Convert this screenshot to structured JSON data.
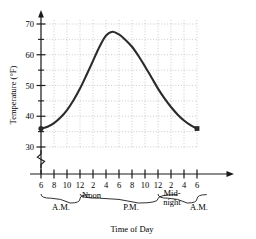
{
  "chart_data": {
    "type": "line",
    "title": "",
    "xlabel": "Time of Day",
    "ylabel": "Temperature (°F)",
    "ylim": [
      30,
      72
    ],
    "yticks": [
      30,
      40,
      50,
      60,
      70
    ],
    "ytick_labels": [
      "30",
      "40",
      "50",
      "60",
      "70"
    ],
    "yminor_ticks": [
      35,
      45,
      55,
      65
    ],
    "axis_break": "zigzag below 30",
    "grid": "dotted, major and minor",
    "legend": "none",
    "xtick_labels": [
      "6",
      "8",
      "10",
      "12",
      "2",
      "4",
      "6",
      "8",
      "10",
      "12",
      "2",
      "4",
      "6"
    ],
    "x_hours": [
      6,
      8,
      10,
      12,
      14,
      16,
      18,
      20,
      22,
      24,
      26,
      28,
      30
    ],
    "x": [
      6,
      7,
      8,
      9,
      10,
      11,
      12,
      13,
      14,
      15,
      16,
      17,
      18,
      19,
      20,
      21,
      22,
      23,
      24,
      25,
      26,
      27,
      28,
      29,
      30
    ],
    "values": [
      36.0,
      36.6,
      37.8,
      39.6,
      42.0,
      45.2,
      49.0,
      53.4,
      58.0,
      62.6,
      66.2,
      67.5,
      66.6,
      64.8,
      62.6,
      59.6,
      56.2,
      52.6,
      49.0,
      45.8,
      43.0,
      40.6,
      38.6,
      37.1,
      36.0
    ],
    "endpoints": [
      {
        "x": 6,
        "y": 36.0,
        "marker": "dot"
      },
      {
        "x": 30,
        "y": 36.0,
        "marker": "square"
      }
    ],
    "peak": {
      "x": 17,
      "y": 67.5,
      "label": "4 P.M."
    },
    "annotations": [
      "Noon",
      "Mid-night"
    ],
    "braces": [
      {
        "label": "A.M.",
        "from_tick": 0,
        "to_tick": 3
      },
      {
        "label": "P.M.",
        "from_tick": 3,
        "to_tick": 9
      },
      {
        "label": "A.M.",
        "from_tick": 9,
        "to_tick": 12
      }
    ]
  },
  "axes": {
    "y_title": "Temperature (°F)",
    "x_title": "Time of Day"
  },
  "labels": {
    "noon": "Noon",
    "midnight_line1": "Mid-",
    "midnight_line2": "night",
    "am_first": "A.M.",
    "pm": "P.M.",
    "am_last": "A.M."
  },
  "colors": {
    "curve": "#2b2b2b",
    "axis": "#1a1a1a",
    "grid": "#b9b9b9",
    "background": "#ffffff"
  }
}
